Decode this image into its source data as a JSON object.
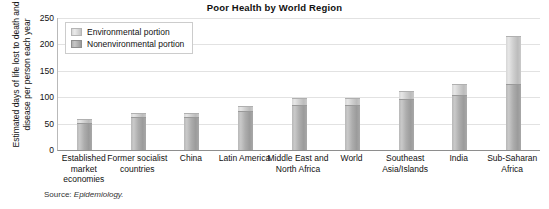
{
  "chart_data": {
    "type": "bar",
    "title": "Poor Health by World Region",
    "xlabel": "",
    "ylabel": "Estimated days of life lost to death and disease per person each year",
    "ylim": [
      0,
      250
    ],
    "yticks": [
      0,
      50,
      100,
      150,
      200,
      250
    ],
    "grid": true,
    "stacked": true,
    "legend_position": "top-left inside plot",
    "categories": [
      "Established market economies",
      "Former socialist countries",
      "China",
      "Latin America",
      "Middle East and North Africa",
      "World",
      "Southeast Asia/Islands",
      "India",
      "Sub-Saharan Africa"
    ],
    "series": [
      {
        "name": "Nonenvironmental portion",
        "color": "#adadad",
        "values": [
          52,
          62,
          63,
          74,
          86,
          86,
          96,
          104,
          125
        ]
      },
      {
        "name": "Environmental portion",
        "color": "#cfcfcf",
        "values": [
          6,
          8,
          8,
          9,
          13,
          13,
          16,
          21,
          90
        ]
      }
    ],
    "totals": [
      58,
      70,
      71,
      83,
      99,
      99,
      112,
      125,
      215
    ],
    "source_note": "Source: Epidemiology."
  },
  "chart": {
    "title": "Poor Health by World Region",
    "ylabel": "Estimated days of life lost to death and disease per person each year",
    "source_prefix": "Source: ",
    "source_name": "Epidemiology.",
    "ytick_labels": [
      "0",
      "50",
      "100",
      "150",
      "200",
      "250"
    ],
    "legend": [
      {
        "label": "Environmental portion",
        "key": "env"
      },
      {
        "label": "Nonenvironmental portion",
        "key": "non"
      }
    ],
    "xtick_labels": [
      "Established market economies",
      "Former socialist countries",
      "China",
      "Latin America",
      "Middle East and North Africa",
      "World",
      "Southeast Asia/Islands",
      "India",
      "Sub-Saharan Africa"
    ]
  }
}
